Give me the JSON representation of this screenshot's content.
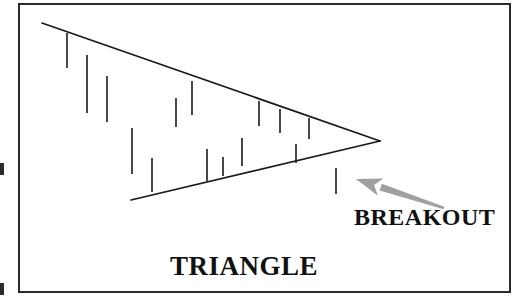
{
  "figure": {
    "kind": "stock-chart-pattern-illustration",
    "background_color": "#ffffff",
    "ink_color": "#1a1a1a",
    "arrow_color": "#a0a0a0",
    "frame": {
      "name": "figure-border",
      "color": "#2b2b2b",
      "x": 19,
      "y": 4,
      "width": 491,
      "height": 288
    },
    "page_edge_marks": [
      {
        "name": "page-edge-mark-top",
        "x": 0,
        "y": 163,
        "width": 4,
        "height": 12
      },
      {
        "name": "page-edge-mark-bottom",
        "x": 0,
        "y": 283,
        "width": 4,
        "height": 12
      }
    ]
  },
  "labels": {
    "triangle": "TRIANGLE",
    "breakout": "BREAKOUT"
  },
  "annotation_arrow": {
    "name": "breakout-arrow",
    "color": "#a0a0a0",
    "tail_x": 444,
    "tail_y": 208,
    "tip_x": 356,
    "tip_y": 179,
    "points_toward": "breakout-price-bar"
  },
  "chart_data": {
    "type": "line",
    "title": "TRIANGLE",
    "subtitle": "BREAKOUT",
    "xlabel": "",
    "ylabel": "",
    "grid": false,
    "legend": null,
    "xlim": [
      19,
      510
    ],
    "ylim": [
      292,
      4
    ],
    "axis_units": "pixels (inverted y: price increases upward)",
    "annotations": [
      {
        "text": "TRIANGLE",
        "x": 240,
        "y": 265
      },
      {
        "text": "BREAKOUT",
        "x": 420,
        "y": 216
      }
    ],
    "series": [
      {
        "name": "upper-trendline",
        "role": "resistance",
        "type": "line",
        "points": [
          [
            42,
            23
          ],
          [
            380,
            141
          ]
        ]
      },
      {
        "name": "lower-trendline",
        "role": "support",
        "type": "line",
        "points": [
          [
            131,
            200
          ],
          [
            380,
            141
          ]
        ]
      }
    ],
    "bars": [
      {
        "index": 1,
        "x": 67,
        "high": 33,
        "low": 68
      },
      {
        "index": 2,
        "x": 87,
        "high": 55,
        "low": 113
      },
      {
        "index": 3,
        "x": 107,
        "high": 76,
        "low": 122
      },
      {
        "index": 4,
        "x": 132,
        "high": 128,
        "low": 174
      },
      {
        "index": 5,
        "x": 152,
        "high": 158,
        "low": 192
      },
      {
        "index": 6,
        "x": 176,
        "high": 98,
        "low": 127
      },
      {
        "index": 7,
        "x": 192,
        "high": 81,
        "low": 115
      },
      {
        "index": 8,
        "x": 207,
        "high": 149,
        "low": 181
      },
      {
        "index": 9,
        "x": 223,
        "high": 157,
        "low": 176
      },
      {
        "index": 10,
        "x": 242,
        "high": 138,
        "low": 166
      },
      {
        "index": 11,
        "x": 259,
        "high": 101,
        "low": 126
      },
      {
        "index": 12,
        "x": 280,
        "high": 109,
        "low": 133
      },
      {
        "index": 13,
        "x": 296,
        "high": 144,
        "low": 163
      },
      {
        "index": 14,
        "x": 309,
        "high": 118,
        "low": 139
      },
      {
        "index": 15,
        "x": 336,
        "high": 168,
        "low": 194,
        "note": "breakout bar, below support"
      }
    ],
    "bar_count": 15,
    "bar_type": "high-low vertical range bars",
    "pattern": "descending / symmetrical triangle with downside breakout",
    "apex": {
      "x": 380,
      "y": 141
    }
  }
}
